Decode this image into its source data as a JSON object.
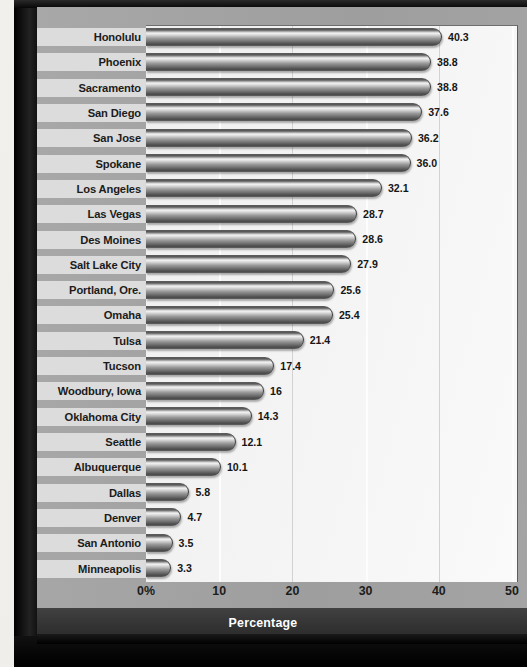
{
  "chart_data": {
    "type": "bar",
    "orientation": "horizontal",
    "title": "",
    "xlabel": "Percentage",
    "ylabel": "",
    "xlim": [
      0,
      50
    ],
    "grid": true,
    "legend": null,
    "xtick_labels": [
      "0%",
      "10",
      "20",
      "30",
      "40",
      "50"
    ],
    "xticks": [
      0,
      10,
      20,
      30,
      40,
      50
    ],
    "categories": [
      "Honolulu",
      "Phoenix",
      "Sacramento",
      "San Diego",
      "San Jose",
      "Spokane",
      "Los Angeles",
      "Las Vegas",
      "Des Moines",
      "Salt Lake City",
      "Portland, Ore.",
      "Omaha",
      "Tulsa",
      "Tucson",
      "Woodbury, Iowa",
      "Oklahoma City",
      "Seattle",
      "Albuquerque",
      "Dallas",
      "Denver",
      "San Antonio",
      "Minneapolis"
    ],
    "values": [
      40.3,
      38.8,
      38.8,
      37.6,
      36.2,
      36.0,
      32.1,
      28.7,
      28.6,
      27.9,
      25.6,
      25.4,
      21.4,
      17.4,
      16,
      14.3,
      12.1,
      10.1,
      5.8,
      4.7,
      3.5,
      3.3
    ],
    "value_labels": [
      "40.3",
      "38.8",
      "38.8",
      "37.6",
      "36.2",
      "36.0",
      "32.1",
      "28.7",
      "28.6",
      "27.9",
      "25.6",
      "25.4",
      "21.4",
      "17.4",
      "16",
      "14.3",
      "12.1",
      "10.1",
      "5.8",
      "4.7",
      "3.5",
      "3.3"
    ]
  },
  "colors": {
    "frame": "#0a0a0a",
    "panel": "#a2a2a2",
    "band": "#dcdcdc",
    "plot_bg": "#f4f4f4",
    "footer_bg": "#343434",
    "text": "#1b1b1b",
    "footer_text": "#ffffff"
  }
}
